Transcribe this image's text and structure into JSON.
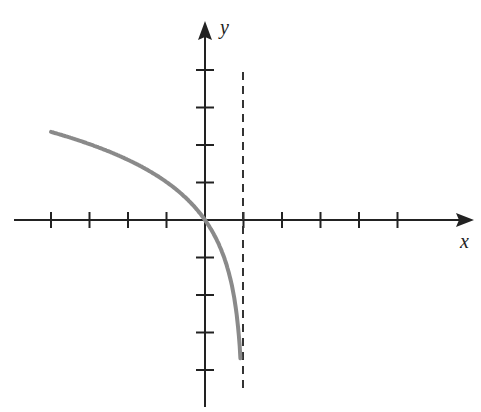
{
  "chart_data": {
    "type": "line",
    "title": "",
    "xlabel": "x",
    "ylabel": "y",
    "xlim": [
      -4,
      7
    ],
    "ylim": [
      -4,
      4
    ],
    "x_ticks": [
      -4,
      -3,
      -2,
      -1,
      1,
      2,
      3,
      4,
      5
    ],
    "y_ticks": [
      -4,
      -3,
      -2,
      -1,
      1,
      2,
      3,
      4
    ],
    "tick_labels_shown": false,
    "grid": false,
    "asymptote": {
      "type": "vertical",
      "x": 1,
      "style": "dashed"
    },
    "series": [
      {
        "name": "f(x)",
        "color": "#8a8a8a",
        "x": [
          -4,
          -3,
          -2,
          -1,
          0,
          0.5,
          0.8,
          0.9,
          0.95
        ],
        "y": [
          2.35,
          2.02,
          1.6,
          1.01,
          0,
          -1.01,
          -2.35,
          -3.36,
          -4.0
        ]
      }
    ]
  },
  "axes": {
    "x_label": "x",
    "y_label": "y"
  }
}
